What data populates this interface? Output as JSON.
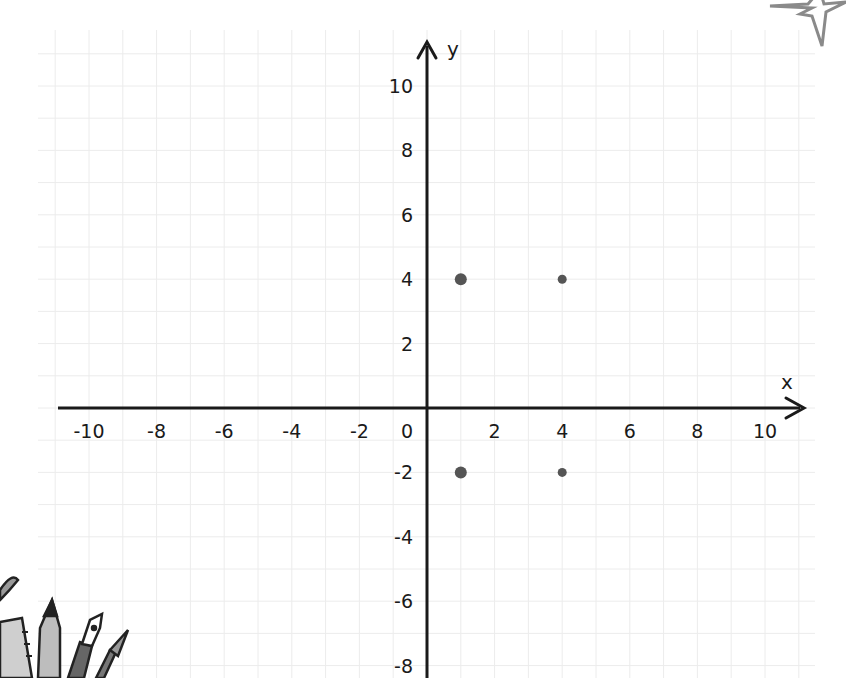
{
  "chart_data": {
    "type": "scatter",
    "title": "",
    "xlabel": "x",
    "ylabel": "y",
    "xlim": [
      -10.5,
      11.2
    ],
    "ylim": [
      -8.5,
      11.2
    ],
    "grid": true,
    "x_ticks": [
      -10,
      -8,
      -6,
      -4,
      -2,
      0,
      2,
      4,
      6,
      8,
      10
    ],
    "y_ticks": [
      10,
      8,
      6,
      4,
      2,
      -2,
      -4,
      -6,
      -8
    ],
    "series": [
      {
        "name": "points",
        "points": [
          {
            "x": 1,
            "y": 4
          },
          {
            "x": 4,
            "y": 4
          },
          {
            "x": 1,
            "y": -2
          },
          {
            "x": 4,
            "y": -2
          }
        ]
      }
    ]
  },
  "colors": {
    "axis": "#1a1a1a",
    "grid": "#ececec",
    "point": "#555555",
    "decoration": "#8a8a8a"
  },
  "decorations": {
    "top_right": "sparkle-icon",
    "bottom_left": "stationery-icon"
  }
}
